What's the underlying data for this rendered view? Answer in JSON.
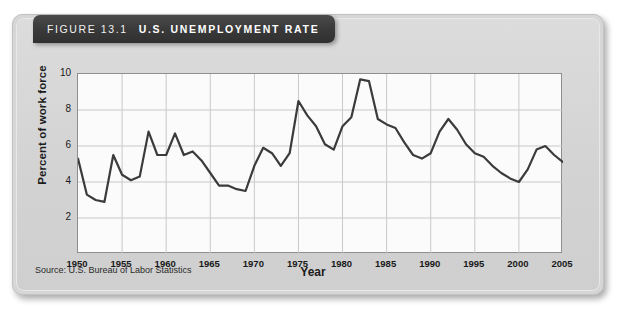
{
  "figure": {
    "number_label": "FIGURE 13.1",
    "title": "U.S. UNEMPLOYMENT RATE",
    "source": "Source: U.S. Bureau of Labor Statistics"
  },
  "colors": {
    "card_background": "#d6d6d6",
    "title_bar": "#3a3a3a",
    "title_text": "#ffffff",
    "plot_background": "#fbfbfb",
    "grid": "#c9c9c9",
    "line": "#3b3b3b",
    "axis": "#8e8e8e"
  },
  "chart_data": {
    "type": "line",
    "title": "U.S. UNEMPLOYMENT RATE",
    "xlabel": "Year",
    "ylabel": "Percent of work force",
    "xlim": [
      1950,
      2005
    ],
    "ylim": [
      0,
      10
    ],
    "yticks": [
      2,
      4,
      6,
      8,
      10
    ],
    "xticks": [
      1950,
      1955,
      1960,
      1965,
      1970,
      1975,
      1980,
      1985,
      1990,
      1995,
      2000,
      2005
    ],
    "grid": true,
    "legend": "none",
    "series": [
      {
        "name": "Unemployment rate",
        "x": [
          1950,
          1951,
          1952,
          1953,
          1954,
          1955,
          1956,
          1957,
          1958,
          1959,
          1960,
          1961,
          1962,
          1963,
          1964,
          1965,
          1966,
          1967,
          1968,
          1969,
          1970,
          1971,
          1972,
          1973,
          1974,
          1975,
          1976,
          1977,
          1978,
          1979,
          1980,
          1981,
          1982,
          1983,
          1984,
          1985,
          1986,
          1987,
          1988,
          1989,
          1990,
          1991,
          1992,
          1993,
          1994,
          1995,
          1996,
          1997,
          1998,
          1999,
          2000,
          2001,
          2002,
          2003,
          2004,
          2005
        ],
        "values": [
          5.3,
          3.3,
          3.0,
          2.9,
          5.5,
          4.4,
          4.1,
          4.3,
          6.8,
          5.5,
          5.5,
          6.7,
          5.5,
          5.7,
          5.2,
          4.5,
          3.8,
          3.8,
          3.6,
          3.5,
          4.9,
          5.9,
          5.6,
          4.9,
          5.6,
          8.5,
          7.7,
          7.1,
          6.1,
          5.8,
          7.1,
          7.6,
          9.7,
          9.6,
          7.5,
          7.2,
          7.0,
          6.2,
          5.5,
          5.3,
          5.6,
          6.8,
          7.5,
          6.9,
          6.1,
          5.6,
          5.4,
          4.9,
          4.5,
          4.2,
          4.0,
          4.7,
          5.8,
          6.0,
          5.5,
          5.1
        ]
      }
    ]
  }
}
